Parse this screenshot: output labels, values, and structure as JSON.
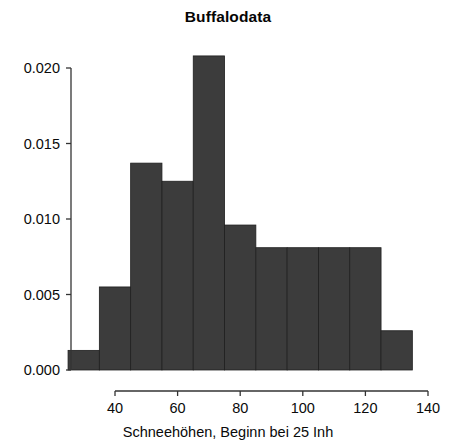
{
  "chart_data": {
    "type": "bar",
    "title": "Buffalodata",
    "xlabel": "Schneehöhen, Beginn bei 25 Inh",
    "ylabel": "",
    "categories": [
      "25-35",
      "35-45",
      "45-55",
      "55-65",
      "65-75",
      "75-85",
      "85-95",
      "95-105",
      "105-115",
      "115-125",
      "125-135"
    ],
    "bin_edges": [
      25,
      35,
      45,
      55,
      65,
      75,
      85,
      95,
      105,
      115,
      125,
      135
    ],
    "values": [
      0.0013,
      0.0055,
      0.0137,
      0.0125,
      0.0208,
      0.0096,
      0.0081,
      0.0081,
      0.0081,
      0.0081,
      0.0026
    ],
    "bar_color": "#3c3c3c",
    "xlim": [
      25,
      135
    ],
    "ylim": [
      0.0,
      0.0208
    ],
    "xticks": [
      40,
      60,
      80,
      100,
      120,
      140
    ],
    "xtick_labels": [
      "40",
      "60",
      "80",
      "100",
      "120",
      "140"
    ],
    "yticks": [
      0.0,
      0.005,
      0.01,
      0.015,
      0.02
    ],
    "ytick_labels": [
      "0.000",
      "0.005",
      "0.010",
      "0.015",
      "0.020"
    ],
    "grid": false,
    "legend": false
  },
  "axes": {
    "axis_color": "#333333"
  }
}
